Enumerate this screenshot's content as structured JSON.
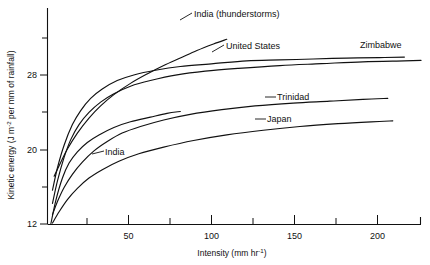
{
  "chart_data": {
    "type": "line",
    "title": "",
    "xlabel": "Intensity (mm hr-1)",
    "xlabel_base": "Intensity  (mm hr",
    "xlabel_exp": "-1",
    "xlabel_tail": ")",
    "ylabel": "Kinetic energy (J m-2 per mm of rainfall)",
    "ylabel_part1": "Kinetic energy  (J m",
    "ylabel_exp": "-2",
    "ylabel_part2": " per mm of rainfall)",
    "xlim": [
      0,
      228
    ],
    "ylim": [
      11.3,
      32.6
    ],
    "grid": false,
    "legend": "inline-labels",
    "xticks_major": [
      50,
      100,
      150,
      200
    ],
    "xtick_labels": [
      "50",
      "100",
      "150",
      "200"
    ],
    "xticks_minor": [
      25,
      75,
      125,
      175
    ],
    "yticks_major": [
      12,
      20,
      28
    ],
    "ytick_labels": [
      "12",
      "20",
      "28"
    ],
    "yticks_minor": [
      16,
      24,
      32
    ],
    "series": [
      {
        "name": "India (thunderstorms)",
        "label": "India (thunderstorms)",
        "label_x": 194,
        "label_y": 14,
        "points": [
          [
            4,
            17.1
          ],
          [
            8,
            18.6
          ],
          [
            12,
            20.0
          ],
          [
            18,
            21.7
          ],
          [
            25,
            23.3
          ],
          [
            32,
            24.6
          ],
          [
            40,
            25.8
          ],
          [
            50,
            27.0
          ],
          [
            60,
            28.0
          ],
          [
            70,
            28.9
          ],
          [
            80,
            29.7
          ],
          [
            90,
            30.5
          ],
          [
            100,
            31.2
          ],
          [
            108,
            31.7
          ]
        ]
      },
      {
        "name": "United States",
        "label": "United States",
        "label_x": 226,
        "label_y": 46,
        "points": [
          [
            3,
            15.6
          ],
          [
            6,
            18.0
          ],
          [
            10,
            20.4
          ],
          [
            15,
            22.6
          ],
          [
            20,
            24.1
          ],
          [
            26,
            25.4
          ],
          [
            33,
            26.4
          ],
          [
            42,
            27.3
          ],
          [
            52,
            27.9
          ],
          [
            65,
            28.4
          ],
          [
            80,
            28.8
          ],
          [
            100,
            29.1
          ],
          [
            120,
            29.4
          ],
          [
            140,
            29.5
          ],
          [
            160,
            29.6
          ],
          [
            180,
            29.7
          ],
          [
            200,
            29.75
          ],
          [
            215,
            29.8
          ]
        ]
      },
      {
        "name": "Zimbabwe",
        "label": "Zimbabwe",
        "label_x": 360,
        "label_y": 45,
        "points": [
          [
            3,
            14.2
          ],
          [
            6,
            16.6
          ],
          [
            10,
            19.1
          ],
          [
            14,
            21.0
          ],
          [
            19,
            22.6
          ],
          [
            25,
            23.9
          ],
          [
            32,
            25.0
          ],
          [
            40,
            25.9
          ],
          [
            50,
            26.7
          ],
          [
            62,
            27.3
          ],
          [
            78,
            27.9
          ],
          [
            95,
            28.3
          ],
          [
            115,
            28.6
          ],
          [
            140,
            28.9
          ],
          [
            165,
            29.1
          ],
          [
            190,
            29.3
          ],
          [
            215,
            29.4
          ],
          [
            225,
            29.45
          ]
        ]
      },
      {
        "name": "Trinidad",
        "label": "Trinidad",
        "label_x": 277,
        "label_y": 98,
        "points": [
          [
            3,
            13.0
          ],
          [
            6,
            14.4
          ],
          [
            10,
            15.9
          ],
          [
            15,
            17.3
          ],
          [
            21,
            18.6
          ],
          [
            28,
            19.8
          ],
          [
            36,
            20.8
          ],
          [
            45,
            21.7
          ],
          [
            56,
            22.4
          ],
          [
            70,
            23.1
          ],
          [
            86,
            23.7
          ],
          [
            105,
            24.2
          ],
          [
            125,
            24.6
          ],
          [
            148,
            24.9
          ],
          [
            170,
            25.1
          ],
          [
            190,
            25.3
          ],
          [
            205,
            25.4
          ]
        ]
      },
      {
        "name": "Japan",
        "label": "Japan",
        "label_x": 267,
        "label_y": 120,
        "points": [
          [
            3,
            12.1
          ],
          [
            7,
            13.3
          ],
          [
            12,
            14.6
          ],
          [
            18,
            15.8
          ],
          [
            25,
            16.9
          ],
          [
            33,
            17.8
          ],
          [
            43,
            18.7
          ],
          [
            55,
            19.5
          ],
          [
            70,
            20.2
          ],
          [
            88,
            20.9
          ],
          [
            108,
            21.5
          ],
          [
            130,
            22.0
          ],
          [
            152,
            22.4
          ],
          [
            175,
            22.7
          ],
          [
            195,
            22.9
          ],
          [
            208,
            23.0
          ]
        ]
      },
      {
        "name": "India",
        "label": "India",
        "label_x": 105,
        "label_y": 152,
        "points": [
          [
            2,
            12.0
          ],
          [
            5,
            14.5
          ],
          [
            9,
            16.9
          ],
          [
            13,
            18.5
          ],
          [
            18,
            19.7
          ],
          [
            24,
            20.7
          ],
          [
            31,
            21.5
          ],
          [
            40,
            22.3
          ],
          [
            50,
            22.9
          ],
          [
            62,
            23.4
          ],
          [
            72,
            23.8
          ],
          [
            80,
            24.0
          ]
        ]
      }
    ],
    "leader_lines": [
      {
        "for": "India (thunderstorms)",
        "x1": 180,
        "y1": 20,
        "x2": 192,
        "y2": 13
      },
      {
        "for": "United States",
        "x1": 212,
        "y1": 52,
        "x2": 224,
        "y2": 45
      },
      {
        "for": "Trinidad",
        "x1": 265,
        "y1": 97,
        "x2": 276,
        "y2": 97
      },
      {
        "for": "Japan",
        "x1": 255,
        "y1": 119,
        "x2": 266,
        "y2": 119
      },
      {
        "for": "India",
        "x1": 92,
        "y1": 154,
        "x2": 104,
        "y2": 151
      }
    ]
  }
}
